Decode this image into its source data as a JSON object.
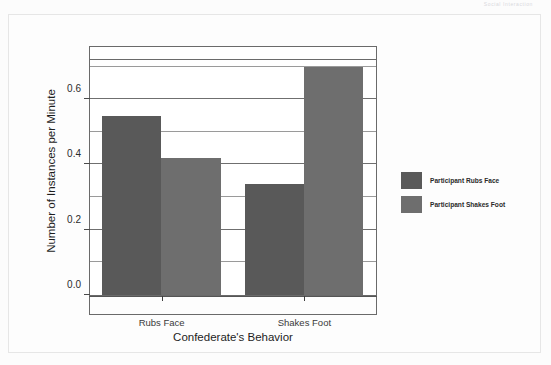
{
  "scan_header": "Social Interaction",
  "chart_data": {
    "type": "bar",
    "title": "",
    "subtitle": "",
    "xlabel": "Confederate's Behavior",
    "ylabel": "Number of Instances per Minute",
    "categories": [
      "Rubs Face",
      "Shakes Foot"
    ],
    "series": [
      {
        "name": "Participant Rubs Face",
        "values": [
          0.55,
          0.34
        ],
        "color": "#595959"
      },
      {
        "name": "Participant Shakes Foot",
        "values": [
          0.42,
          0.7
        ],
        "color": "#6e6e6e"
      }
    ],
    "ylim": [
      0.0,
      0.72
    ],
    "ytick_labels": [
      "0.0",
      "0.2",
      "0.4",
      "0.6"
    ],
    "ytick_values": [
      0.0,
      0.2,
      0.4,
      0.6
    ],
    "minor_gridline_values": [
      0.1,
      0.3,
      0.5,
      0.7
    ],
    "grid": true,
    "legend_position": "right",
    "bar_grouping": "adjacent-no-gap"
  }
}
